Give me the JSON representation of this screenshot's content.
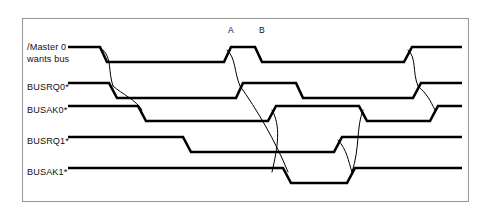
{
  "figure": {
    "kind": "timing-diagram",
    "title_visible": false,
    "frame": {
      "x": 22.5,
      "y": 18.5,
      "width": 446,
      "height": 183,
      "border_color": "#9a9a9a",
      "background_color": "#ffffff"
    },
    "stroke_color": "#000000",
    "wave_stroke_width": 2.6,
    "arc_stroke_width": 1.0
  },
  "markers": [
    {
      "id": "marker-a",
      "label": "A",
      "x": 228,
      "y": 33
    },
    {
      "id": "marker-b",
      "label": "B",
      "x": 259,
      "y": 33
    }
  ],
  "signals": [
    {
      "id": "master0-wants-bus",
      "label_lines": [
        "/Master 0",
        "wants bus"
      ],
      "label_x": 27,
      "label_y_first": 50,
      "label_line_height": 11.5,
      "high_y": 47,
      "low_y": 62,
      "trace_start_x": 68,
      "trace_end_x": 462,
      "path": "M 68,47 L 100,47 L 107,62 L 224,62 L 231,47 L 255,47 L 262,62 L 404,62 L 412,47 L 462,47"
    },
    {
      "id": "busrq0",
      "label_lines": [
        "BUSRQ0*"
      ],
      "label_x": 27,
      "label_y_first": 90,
      "label_line_height": 11.5,
      "high_y": 83,
      "low_y": 98,
      "trace_start_x": 68,
      "trace_end_x": 462,
      "path": "M 68,83 L 109,83 L 117,98 L 236,98 L 243,83 L 296,83 L 303,98 L 413,98 L 421,83 L 462,83"
    },
    {
      "id": "busak0",
      "label_lines": [
        "BUSAK0*"
      ],
      "label_x": 27,
      "label_y_first": 113,
      "label_line_height": 11.5,
      "high_y": 106,
      "low_y": 121,
      "trace_start_x": 68,
      "trace_end_x": 462,
      "path": "M 68,106 L 138,106 L 146,121 L 268,121 L 276,106 L 359,106 L 367,121 L 430,121 L 438,106 L 462,106"
    },
    {
      "id": "busrq1",
      "label_lines": [
        "BUSRQ1*"
      ],
      "label_x": 27,
      "label_y_first": 144,
      "label_line_height": 11.5,
      "high_y": 137,
      "low_y": 152,
      "trace_start_x": 68,
      "trace_end_x": 462,
      "path": "M 68,137 L 183,137 L 191,152 L 334,152 L 342,137 L 462,137"
    },
    {
      "id": "busak1",
      "label_lines": [
        "BUSAK1*"
      ],
      "label_x": 27,
      "label_y_first": 175,
      "label_line_height": 11.5,
      "high_y": 168,
      "low_y": 183,
      "trace_start_x": 68,
      "trace_end_x": 462,
      "path": "M 68,168 L 283,168 L 291,183 L 347,183 L 355,168 L 462,168"
    }
  ],
  "causality_arcs": [
    {
      "id": "arc-master-fall-to-busrq0-fall",
      "path": "M 103,50 C 112,58 108,72 113,86"
    },
    {
      "id": "arc-busrq0-fall-to-busak0-fall",
      "path": "M 113,86 C 122,94 136,100 142,110"
    },
    {
      "id": "arc-master-pulse-to-busrq0-rise",
      "path": "M 227,50 C 236,58 234,72 240,86"
    },
    {
      "id": "arc-busrq0-rise-to-busak1-fall",
      "path": "M 240,86 C 256,108 276,142 288,172"
    },
    {
      "id": "arc-busak0-rise-to-busrq1-low",
      "path": "M 272,110 C 281,126 278,146 272,172"
    },
    {
      "id": "arc-busak1-rise-to-busak0-fall",
      "path": "M 352,172 C 360,148 356,128 363,110"
    },
    {
      "id": "arc-busrq1-rise-to-busak1-rise",
      "path": "M 338,140 C 347,150 348,160 352,172"
    },
    {
      "id": "arc-master-rise-to-busrq0-rise-end",
      "path": "M 408,50 C 417,58 412,72 418,86"
    },
    {
      "id": "arc-busrq0-rise-end-to-busak0-rise",
      "path": "M 418,86 C 427,94 430,100 435,110"
    }
  ]
}
